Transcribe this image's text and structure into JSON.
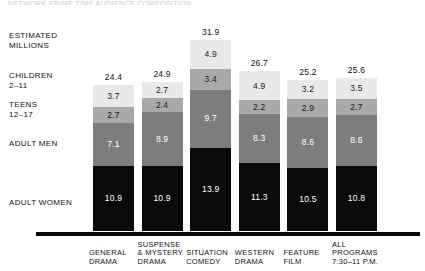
{
  "title_strip": "NETWORK PRIME TIME AUDIENCE COMPOSITION",
  "legend": {
    "estimated": "ESTIMATED\nMILLIONS",
    "children": "CHILDREN\n2–11",
    "teens": "TEENS\n12–17",
    "adult_men": "ADULT MEN",
    "adult_women": "ADULT WOMEN"
  },
  "chart_data": {
    "type": "bar",
    "title": "",
    "xlabel": "",
    "ylabel": "ESTIMATED MILLIONS",
    "ylim": [
      0,
      31.9
    ],
    "grid": false,
    "legend_position": "left",
    "stacked": true,
    "categories": [
      "GENERAL\nDRAMA",
      "SUSPENSE\n& MYSTERY\nDRAMA",
      "SITUATION\nCOMEDY",
      "WESTERN\nDRAMA",
      "FEATURE\nFILM",
      "ALL PROGRAMS\n7:30–11 P.M."
    ],
    "totals": [
      24.4,
      24.9,
      31.9,
      26.7,
      25.2,
      25.6
    ],
    "series": [
      {
        "name": "CHILDREN 2–11",
        "key": "children",
        "color": "#e9e9e9",
        "values": [
          3.7,
          2.7,
          4.9,
          4.9,
          3.2,
          3.5
        ]
      },
      {
        "name": "TEENS 12–17",
        "key": "teens",
        "color": "#a9a9a9",
        "values": [
          2.7,
          2.4,
          3.4,
          2.2,
          2.9,
          2.7
        ]
      },
      {
        "name": "ADULT MEN",
        "key": "adult_men",
        "color": "#7d7d7d",
        "values": [
          7.1,
          8.9,
          9.7,
          8.3,
          8.6,
          8.6
        ]
      },
      {
        "name": "ADULT WOMEN",
        "key": "adult_women",
        "color": "#0a0a0a",
        "values": [
          10.9,
          10.9,
          13.9,
          11.3,
          10.5,
          10.8
        ]
      }
    ]
  }
}
